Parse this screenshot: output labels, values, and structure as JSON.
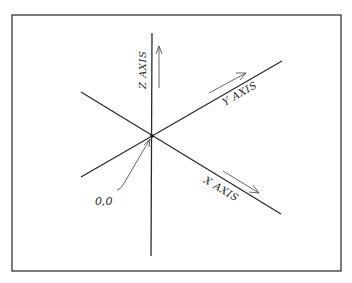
{
  "diagram": {
    "frame": {
      "x": 12,
      "y": 15,
      "width": 329,
      "height": 256,
      "stroke": "#333333"
    },
    "origin": {
      "x": 152,
      "y": 136,
      "label": "0,0"
    },
    "axes": [
      {
        "name": "Z AXIS",
        "line": {
          "x1": 152,
          "y1": 33,
          "x2": 151,
          "y2": 256
        },
        "arrow": {
          "x1": 159,
          "y1": 88,
          "x2": 159,
          "y2": 46
        },
        "label": "Z AXIS"
      },
      {
        "name": "Y AXIS",
        "line": {
          "x1": 81,
          "y1": 177,
          "x2": 282,
          "y2": 61
        },
        "arrow": {
          "x1": 209,
          "y1": 93,
          "x2": 246,
          "y2": 73
        },
        "label": "Y AXIS"
      },
      {
        "name": "X AXIS",
        "line": {
          "x1": 81,
          "y1": 92,
          "x2": 281,
          "y2": 214
        },
        "arrow": {
          "x1": 223,
          "y1": 171,
          "x2": 259,
          "y2": 193
        },
        "label": "X AXIS"
      }
    ],
    "colors": {
      "line": "#2b2b2b",
      "arrow": "#555555",
      "background": "#ffffff"
    }
  }
}
